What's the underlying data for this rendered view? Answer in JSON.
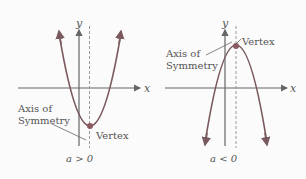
{
  "left_graph": {
    "y_axis_label": "y",
    "x_axis_label": "x",
    "axis_label_line1": "Axis of",
    "axis_label_line2": "Symmetry",
    "vertex_label": "Vertex",
    "condition": "a > 0"
  },
  "right_graph": {
    "y_axis_label": "y",
    "x_axis_label": "x",
    "axis_label_line1": "Axis of",
    "axis_label_line2": "Symmetry",
    "vertex_label": "Vertex",
    "condition": "a < 0"
  },
  "colors": {
    "axis": "#666666",
    "parabola": "#7a5a5e",
    "vertex": "#8a5a60",
    "dashed": "#999999",
    "text": "#555555"
  }
}
